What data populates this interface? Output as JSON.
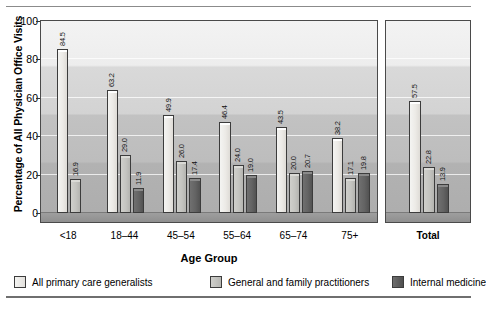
{
  "chart_data": {
    "type": "bar",
    "title": "",
    "xlabel": "Age Group",
    "ylabel": "Percentage of All Physician Office Visits",
    "ylim": [
      0,
      100
    ],
    "yticks": [
      0,
      20,
      40,
      60,
      80,
      100
    ],
    "grid": true,
    "legend_position": "bottom",
    "categories": [
      "<18",
      "18–44",
      "45–54",
      "55–64",
      "65–74",
      "75+",
      "Total"
    ],
    "series": [
      {
        "name": "All primary care generalists",
        "color": "#ece9e5",
        "values": [
          84.5,
          63.2,
          49.9,
          46.4,
          43.5,
          38.2,
          57.5
        ],
        "labels": [
          "84.5",
          "63.2",
          "49.9",
          "46.4",
          "43.5",
          "38.2",
          "57.5"
        ]
      },
      {
        "name": "General and family practitioners",
        "color": "#c4c4c0",
        "values": [
          16.9,
          29.0,
          26.0,
          24.0,
          20.0,
          17.1,
          22.8
        ],
        "labels": [
          "16.9",
          "29.0",
          "26.0",
          "24.0",
          "20.0",
          "17.1",
          "22.8"
        ]
      },
      {
        "name": "Internal medicine",
        "color": "#5f5f5f",
        "values": [
          null,
          11.9,
          17.4,
          19.0,
          20.7,
          19.8,
          13.9
        ],
        "labels": [
          "",
          "11.9",
          "17.4",
          "19.0",
          "20.7",
          "19.8",
          "13.9"
        ]
      }
    ]
  },
  "axis": {
    "y_title": "Percentage of All Physician Office Visits",
    "x_title": "Age Group",
    "y_tick_labels": [
      "100",
      "80",
      "60",
      "40",
      "20",
      "0"
    ]
  },
  "legend": {
    "items": [
      {
        "label": "All primary care generalists"
      },
      {
        "label": "General and family practitioners"
      },
      {
        "label": "Internal medicine"
      }
    ]
  },
  "x_labels": [
    {
      "text": "<18",
      "bold": false
    },
    {
      "text": "18–44",
      "bold": false
    },
    {
      "text": "45–54",
      "bold": false
    },
    {
      "text": "55–64",
      "bold": false
    },
    {
      "text": "65–74",
      "bold": false
    },
    {
      "text": "75+",
      "bold": false
    },
    {
      "text": "Total",
      "bold": true
    }
  ]
}
